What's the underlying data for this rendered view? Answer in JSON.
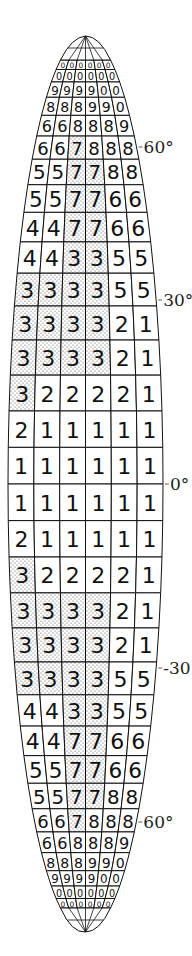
{
  "figure": {
    "type": "gore-grid",
    "columns": 6,
    "stipple_color": "#888888",
    "line_color": "#111111",
    "rows": [
      {
        "values": [
          "0",
          "0",
          "0",
          "0",
          "0",
          "0"
        ],
        "shaded": []
      },
      {
        "values": [
          "0",
          "0",
          "0",
          "0",
          "0",
          "0"
        ],
        "shaded": []
      },
      {
        "values": [
          "9",
          "9",
          "9",
          "9",
          "0",
          "0"
        ],
        "shaded": []
      },
      {
        "values": [
          "8",
          "8",
          "8",
          "9",
          "9",
          "0"
        ],
        "shaded": []
      },
      {
        "values": [
          "6",
          "6",
          "8",
          "8",
          "8",
          "9"
        ],
        "shaded": []
      },
      {
        "values": [
          "6",
          "6",
          "7",
          "8",
          "8",
          "8"
        ],
        "shaded": [
          2
        ]
      },
      {
        "values": [
          "5",
          "5",
          "7",
          "7",
          "8",
          "8"
        ],
        "shaded": [
          2,
          3
        ]
      },
      {
        "values": [
          "5",
          "5",
          "7",
          "7",
          "6",
          "6"
        ],
        "shaded": [
          2,
          3
        ]
      },
      {
        "values": [
          "4",
          "4",
          "7",
          "7",
          "6",
          "6"
        ],
        "shaded": [
          2,
          3
        ]
      },
      {
        "values": [
          "4",
          "4",
          "3",
          "3",
          "5",
          "5"
        ],
        "shaded": [
          2,
          3
        ]
      },
      {
        "values": [
          "3",
          "3",
          "3",
          "3",
          "5",
          "5"
        ],
        "shaded": [
          0,
          1,
          2,
          3
        ]
      },
      {
        "values": [
          "3",
          "3",
          "3",
          "3",
          "2",
          "1"
        ],
        "shaded": [
          0,
          1,
          2,
          3
        ]
      },
      {
        "values": [
          "3",
          "3",
          "3",
          "3",
          "2",
          "1"
        ],
        "shaded": [
          0,
          1,
          2,
          3
        ]
      },
      {
        "values": [
          "3",
          "2",
          "2",
          "2",
          "2",
          "1"
        ],
        "shaded": [
          0
        ]
      },
      {
        "values": [
          "2",
          "1",
          "1",
          "1",
          "1",
          "1"
        ],
        "shaded": []
      },
      {
        "values": [
          "1",
          "1",
          "1",
          "1",
          "1",
          "1"
        ],
        "shaded": []
      },
      {
        "values": [
          "1",
          "1",
          "1",
          "1",
          "1",
          "1"
        ],
        "shaded": []
      },
      {
        "values": [
          "2",
          "1",
          "1",
          "1",
          "1",
          "1"
        ],
        "shaded": []
      },
      {
        "values": [
          "3",
          "2",
          "2",
          "2",
          "2",
          "1"
        ],
        "shaded": [
          0
        ]
      },
      {
        "values": [
          "3",
          "3",
          "3",
          "3",
          "2",
          "1"
        ],
        "shaded": [
          0,
          1,
          2,
          3
        ]
      },
      {
        "values": [
          "3",
          "3",
          "3",
          "3",
          "2",
          "1"
        ],
        "shaded": [
          0,
          1,
          2,
          3
        ]
      },
      {
        "values": [
          "3",
          "3",
          "3",
          "3",
          "5",
          "5"
        ],
        "shaded": [
          0,
          1,
          2,
          3
        ]
      },
      {
        "values": [
          "4",
          "4",
          "3",
          "3",
          "5",
          "5"
        ],
        "shaded": [
          2,
          3
        ]
      },
      {
        "values": [
          "4",
          "4",
          "7",
          "7",
          "6",
          "6"
        ],
        "shaded": [
          2,
          3
        ]
      },
      {
        "values": [
          "5",
          "5",
          "7",
          "7",
          "6",
          "6"
        ],
        "shaded": [
          2,
          3
        ]
      },
      {
        "values": [
          "5",
          "5",
          "7",
          "7",
          "8",
          "8"
        ],
        "shaded": [
          2,
          3
        ]
      },
      {
        "values": [
          "6",
          "6",
          "7",
          "8",
          "8",
          "8"
        ],
        "shaded": [
          2
        ]
      },
      {
        "values": [
          "6",
          "6",
          "8",
          "8",
          "8",
          "9"
        ],
        "shaded": []
      },
      {
        "values": [
          "8",
          "8",
          "8",
          "9",
          "9",
          "0"
        ],
        "shaded": []
      },
      {
        "values": [
          "9",
          "9",
          "9",
          "9",
          "0",
          "0"
        ],
        "shaded": []
      },
      {
        "values": [
          "0",
          "0",
          "0",
          "0",
          "0",
          "0"
        ],
        "shaded": []
      },
      {
        "values": [
          "0",
          "0",
          "0",
          "0",
          "0",
          "0"
        ],
        "shaded": []
      }
    ],
    "latitude_labels": [
      {
        "text": "60°",
        "y": 147
      },
      {
        "text": "30°",
        "y": 300
      },
      {
        "text": "0°",
        "y": 484
      },
      {
        "text": "-30°",
        "y": 668
      },
      {
        "text": "60°",
        "y": 822
      }
    ]
  }
}
